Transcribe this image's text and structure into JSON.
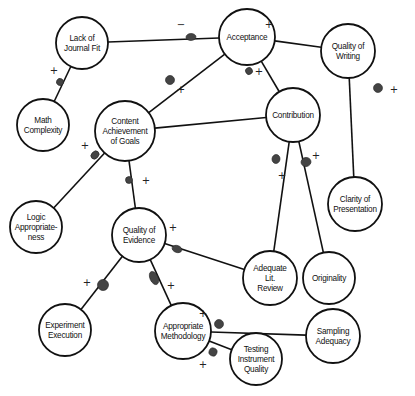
{
  "diagram": {
    "title": "",
    "nodes": [
      {
        "id": "lack_fit",
        "lines": [
          "Lack of",
          "Journal Fit"
        ],
        "cx": 82,
        "cy": 43,
        "r": 26
      },
      {
        "id": "acceptance",
        "lines": [
          "Acceptance"
        ],
        "cx": 247,
        "cy": 37,
        "r": 28
      },
      {
        "id": "quality_writing",
        "lines": [
          "Quality of",
          "Writing"
        ],
        "cx": 348,
        "cy": 51,
        "r": 27
      },
      {
        "id": "math_complexity",
        "lines": [
          "Math",
          "Complexity"
        ],
        "cx": 43,
        "cy": 125,
        "r": 26
      },
      {
        "id": "content_achievement",
        "lines": [
          "Content",
          "Achievement",
          "of Goals"
        ],
        "cx": 125,
        "cy": 131,
        "r": 30
      },
      {
        "id": "contribution",
        "lines": [
          "Contribution"
        ],
        "cx": 293,
        "cy": 115,
        "r": 27
      },
      {
        "id": "logic",
        "lines": [
          "Logic",
          "Appropriate-",
          "ness"
        ],
        "cx": 36,
        "cy": 227,
        "r": 26
      },
      {
        "id": "quality_evidence",
        "lines": [
          "Quality of",
          "Evidence"
        ],
        "cx": 139,
        "cy": 235,
        "r": 27
      },
      {
        "id": "clarity",
        "lines": [
          "Clarity of",
          "Presentation"
        ],
        "cx": 355,
        "cy": 204,
        "r": 27
      },
      {
        "id": "lit_review",
        "lines": [
          "Adequate",
          "Lit.",
          "Review"
        ],
        "cx": 270,
        "cy": 278,
        "r": 27
      },
      {
        "id": "originality",
        "lines": [
          "Originality"
        ],
        "cx": 329,
        "cy": 278,
        "r": 26
      },
      {
        "id": "experiment",
        "lines": [
          "Experiment",
          "Execution"
        ],
        "cx": 65,
        "cy": 330,
        "r": 26
      },
      {
        "id": "methodology",
        "lines": [
          "Appropriate",
          "Methodology"
        ],
        "cx": 183,
        "cy": 331,
        "r": 28
      },
      {
        "id": "testing",
        "lines": [
          "Testing",
          "Instrument",
          "Quality"
        ],
        "cx": 256,
        "cy": 359,
        "r": 26
      },
      {
        "id": "sampling",
        "lines": [
          "Sampling",
          "Adequacy"
        ],
        "cx": 333,
        "cy": 336,
        "r": 27
      }
    ],
    "edges": [
      {
        "from": "lack_fit",
        "to": "acceptance",
        "sign": "−",
        "marker": [
          191,
          37
        ],
        "marker_r": [
          3.5,
          5
        ],
        "sign_pos": [
          181,
          25
        ]
      },
      {
        "from": "quality_writing",
        "to": "acceptance",
        "sign": "+",
        "marker": [
          261,
          38
        ],
        "marker_r": [
          4,
          4
        ],
        "sign_pos": [
          269,
          25
        ]
      },
      {
        "from": "math_complexity",
        "to": "lack_fit",
        "sign": "+",
        "marker": [
          60,
          82
        ],
        "marker_r": [
          3.5,
          3.5
        ],
        "sign_pos": [
          54,
          71
        ]
      },
      {
        "from": "content_achievement",
        "to": "acceptance",
        "sign": "+",
        "marker": [
          170,
          80
        ],
        "marker_r": [
          4.5,
          4.5
        ],
        "sign_pos": [
          181,
          90
        ]
      },
      {
        "from": "contribution",
        "to": "acceptance",
        "sign": "+",
        "marker": [
          249,
          71
        ],
        "marker_r": [
          3.5,
          3.5
        ],
        "sign_pos": [
          259,
          72
        ]
      },
      {
        "from": "content_achievement",
        "to": "contribution",
        "sign": "",
        "marker": null
      },
      {
        "from": "clarity",
        "to": "quality_writing",
        "sign": "+",
        "marker": [
          378,
          88
        ],
        "marker_r": [
          4.5,
          4.5
        ],
        "sign_pos": [
          394,
          90
        ]
      },
      {
        "from": "logic",
        "to": "content_achievement",
        "sign": "+",
        "marker": [
          95,
          155
        ],
        "marker_r": [
          3.5,
          4.5
        ],
        "sign_pos": [
          85,
          146
        ]
      },
      {
        "from": "quality_evidence",
        "to": "content_achievement",
        "sign": "+",
        "marker": [
          129,
          180
        ],
        "marker_r": [
          3.5,
          3.5
        ],
        "sign_pos": [
          146,
          181
        ]
      },
      {
        "from": "lit_review",
        "to": "contribution",
        "sign": "+",
        "marker": [
          276,
          159
        ],
        "marker_r": [
          4,
          4.5
        ],
        "sign_pos": [
          282,
          176
        ]
      },
      {
        "from": "originality",
        "to": "contribution",
        "sign": "+",
        "marker": [
          306,
          162
        ],
        "marker_r": [
          5,
          4.5
        ],
        "sign_pos": [
          316,
          156
        ]
      },
      {
        "from": "lit_review",
        "to": "quality_evidence",
        "sign": "+",
        "marker": [
          177,
          249
        ],
        "marker_r": [
          3.5,
          5
        ],
        "sign_pos": [
          173,
          228
        ]
      },
      {
        "from": "experiment",
        "to": "quality_evidence",
        "sign": "+",
        "marker": [
          103,
          285
        ],
        "marker_r": [
          5.5,
          5.5
        ],
        "sign_pos": [
          87,
          283
        ]
      },
      {
        "from": "methodology",
        "to": "quality_evidence",
        "sign": "+",
        "marker": [
          154,
          278
        ],
        "marker_r": [
          4,
          7
        ],
        "sign_pos": [
          171,
          286
        ]
      },
      {
        "from": "sampling",
        "to": "methodology",
        "sign": "+",
        "marker": [
          219,
          324
        ],
        "marker_r": [
          4.5,
          4.5
        ],
        "sign_pos": [
          203,
          314
        ]
      },
      {
        "from": "testing",
        "to": "methodology",
        "sign": "+",
        "marker": [
          213,
          352
        ],
        "marker_r": [
          4,
          4
        ],
        "sign_pos": [
          203,
          365
        ]
      }
    ]
  }
}
